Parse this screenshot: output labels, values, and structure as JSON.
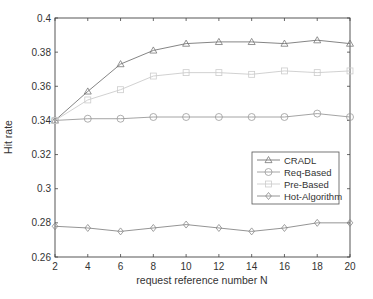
{
  "chart_data": {
    "type": "line",
    "title": "",
    "xlabel": "request reference number N",
    "ylabel": "Hit rate",
    "x": [
      2,
      4,
      6,
      8,
      10,
      12,
      14,
      16,
      18,
      20
    ],
    "xlim": [
      2,
      20
    ],
    "ylim": [
      0.26,
      0.4
    ],
    "xticks": [
      2,
      4,
      6,
      8,
      10,
      12,
      14,
      16,
      18,
      20
    ],
    "yticks": [
      0.26,
      0.28,
      0.3,
      0.32,
      0.34,
      0.36,
      0.38,
      0.4
    ],
    "ytick_labels": [
      "0.26",
      "0.28",
      "0.3",
      "0.32",
      "0.34",
      "0.36",
      "0.38",
      "0.4"
    ],
    "grid": false,
    "legend_position": "center-right",
    "series": [
      {
        "name": "CRADL",
        "marker": "triangle",
        "color": "#777777",
        "values": [
          0.34,
          0.357,
          0.373,
          0.381,
          0.385,
          0.386,
          0.386,
          0.385,
          0.387,
          0.385
        ]
      },
      {
        "name": "Req-Based",
        "marker": "circle",
        "color": "#9a9a9a",
        "values": [
          0.34,
          0.341,
          0.341,
          0.342,
          0.342,
          0.342,
          0.342,
          0.342,
          0.344,
          0.342
        ]
      },
      {
        "name": "Pre-Based",
        "marker": "square",
        "color": "#cccccc",
        "values": [
          0.34,
          0.352,
          0.358,
          0.366,
          0.368,
          0.368,
          0.367,
          0.369,
          0.368,
          0.369
        ]
      },
      {
        "name": "Hot-Algorithm",
        "marker": "diamond",
        "color": "#888888",
        "values": [
          0.278,
          0.277,
          0.275,
          0.277,
          0.279,
          0.277,
          0.275,
          0.277,
          0.28,
          0.28
        ]
      }
    ]
  }
}
